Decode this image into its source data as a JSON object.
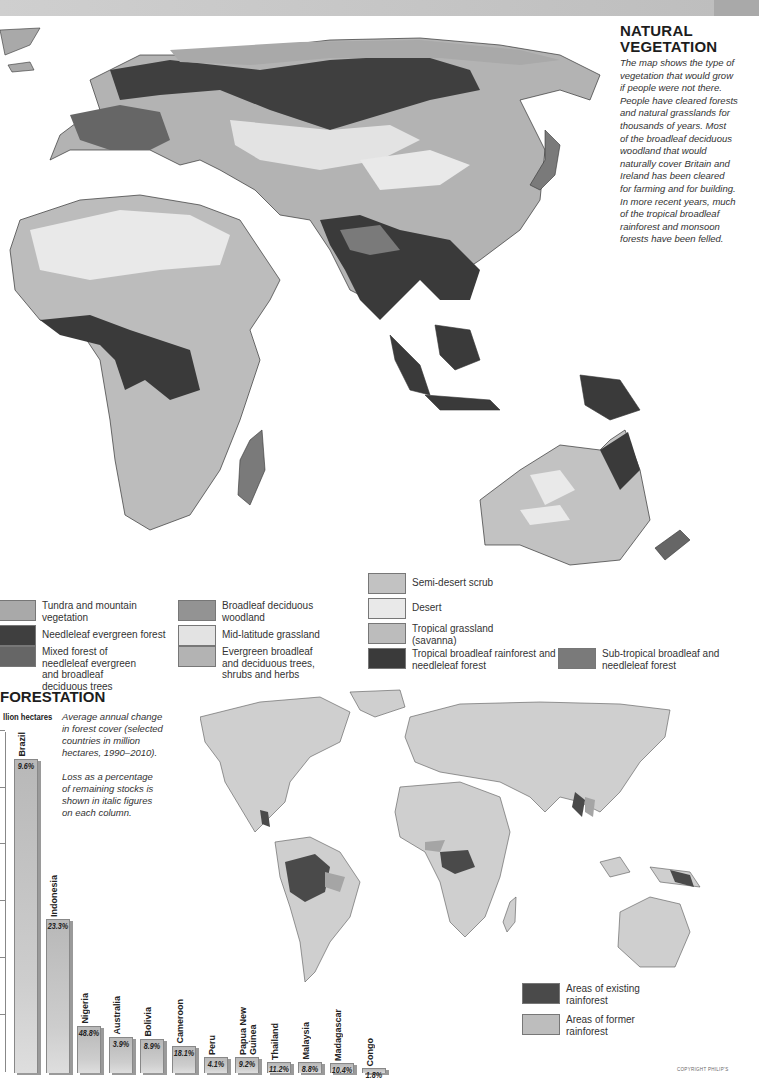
{
  "vegetation": {
    "title_line1": "NATURAL",
    "title_line2": "VEGETATION",
    "description": [
      "The map shows the type of",
      "vegetation that would grow",
      "if people were not there.",
      "People have cleared forests",
      "and natural grasslands for",
      "thousands of years. Most",
      "of the broadleaf deciduous",
      "woodland that would",
      "naturally cover Britain and",
      "Ireland has been cleared",
      "for farming and for building.",
      "In more recent years, much",
      "of the tropical broadleaf",
      "rainforest and monsoon",
      "forests have been felled."
    ],
    "legend": [
      {
        "label": "Tundra and mountain vegetation",
        "color": "#a9a9a9"
      },
      {
        "label": "Needleleaf evergreen forest",
        "color": "#3f3f3f"
      },
      {
        "label": "Mixed forest of needleleaf evergreen and broadleaf deciduous trees",
        "color": "#666666"
      },
      {
        "label": "Broadleaf deciduous woodland",
        "color": "#939393"
      },
      {
        "label": "Mid-latitude grassland",
        "color": "#e3e3e3"
      },
      {
        "label": "Evergreen broadleaf and deciduous trees, shrubs and herbs",
        "color": "#b3b3b3"
      },
      {
        "label": "Semi-desert scrub",
        "color": "#c2c2c2"
      },
      {
        "label": "Desert",
        "color": "#e9e9e9"
      },
      {
        "label": "Tropical grassland (savanna)",
        "color": "#bcbcbc"
      },
      {
        "label": "Tropical broadleaf rainforest and needleleaf forest",
        "color": "#3a3a3a"
      },
      {
        "label": "Sub-tropical broadleaf and needleleaf forest",
        "color": "#7a7a7a"
      }
    ]
  },
  "deforestation": {
    "title": "FORESTATION",
    "unit_label": "llion hectares",
    "description_1": [
      "Average annual change",
      "in forest cover (selected",
      "countries in million",
      "hectares, 1990–2010)."
    ],
    "description_2": [
      "Loss as a percentage",
      "of remaining stocks is",
      "shown in italic figures",
      "on each column."
    ],
    "map_legend": [
      {
        "label_line1": "Areas of existing",
        "label_line2": "rainforest",
        "color": "#4a4a4a"
      },
      {
        "label_line1": "Areas of former",
        "label_line2": "rainforest",
        "color": "#bdbdbd"
      }
    ],
    "copyright": "COPYRIGHT PHILIP'S"
  },
  "chart_data": {
    "type": "bar",
    "ylabel": "million hectares",
    "xlabel": "",
    "note": "Axis tick labels are cropped; values are relative bar heights estimated in pixel units (baseline to top). Italic figures = loss as % of remaining stocks.",
    "grid": false,
    "categories": [
      "Brazil",
      "Indonesia",
      "Nigeria",
      "Australia",
      "Bolivia",
      "Cameroon",
      "Peru",
      "Papua New Guinea",
      "Thailand",
      "Malaysia",
      "Madagascar",
      "Congo"
    ],
    "series": [
      {
        "name": "Relative bar height (px)",
        "values": [
          313,
          153,
          46,
          35,
          33,
          26,
          15,
          15,
          10,
          10,
          9,
          4
        ]
      },
      {
        "name": "Loss as % of remaining stocks",
        "values": [
          9.6,
          23.3,
          48.8,
          3.9,
          8.9,
          18.1,
          4.1,
          9.2,
          11.2,
          8.8,
          10.4,
          1.8
        ]
      }
    ],
    "pct_labels": [
      "9.6%",
      "23.3%",
      "48.8%",
      "3.9%",
      "8.9%",
      "18.1%",
      "4.1%",
      "9.2%",
      "11.2%",
      "8.8%",
      "10.4%",
      "1.8%"
    ]
  }
}
